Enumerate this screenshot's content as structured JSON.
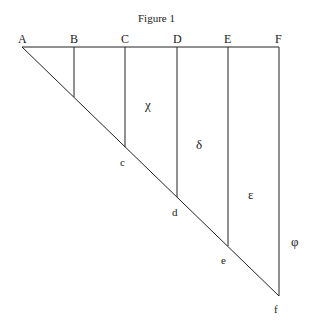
{
  "title": "Figure 1",
  "top_labels": [
    "A",
    "B",
    "C",
    "D",
    "E",
    "F"
  ],
  "bottom_labels": [
    "c",
    "d",
    "e",
    "f"
  ],
  "region_labels": {
    "chi": "χ",
    "delta": "δ",
    "epsilon": "ε",
    "phi": "φ"
  },
  "colors": {
    "line": "#222222",
    "background": "#ffffff"
  }
}
